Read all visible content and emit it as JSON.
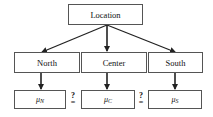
{
  "root": {
    "label": "Location"
  },
  "children": [
    {
      "label": "North",
      "mean_symbol": "μ",
      "mean_subscript": "N"
    },
    {
      "label": "Center",
      "mean_symbol": "μ",
      "mean_subscript": "C"
    },
    {
      "label": "South",
      "mean_symbol": "μ",
      "mean_subscript": "S"
    }
  ],
  "comparisons": [
    {
      "between": "N-C",
      "symbol": "?="
    },
    {
      "between": "C-S",
      "symbol": "?="
    }
  ],
  "symbols": {
    "question": "?",
    "equals": "="
  }
}
